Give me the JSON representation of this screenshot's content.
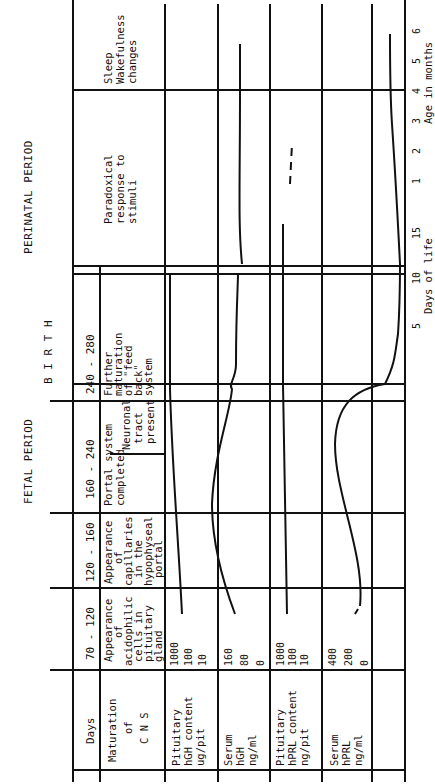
{
  "periods": {
    "fetal": "FETAL PERIOD",
    "birth": "B I R T H",
    "perinatal": "PERINATAL PERIOD"
  },
  "header": {
    "days_label": "Days",
    "columns": [
      "70 - 120",
      "120 - 160",
      "160 - 240",
      "240 - 280"
    ]
  },
  "cns_row": {
    "label_lines": [
      "Maturation",
      "of",
      "C N S"
    ],
    "cells": [
      [
        "Appearance",
        "of",
        "acidophilic",
        "cells in",
        "pituitary",
        "gland"
      ],
      [
        "Appearance",
        "of",
        "capillaries",
        "in the",
        "hypophyseal",
        "portal",
        "system"
      ],
      [
        "Portal system",
        "completed"
      ],
      [
        "Further",
        "maturation",
        "of \"feed",
        "back\"",
        "system"
      ]
    ],
    "neuronal": [
      "Neuronal",
      "tract",
      "present"
    ],
    "perinatal": [
      "Paradoxical",
      "response to",
      "stimuli"
    ],
    "postnatal": [
      "Sleep",
      "Wakefulness",
      "changes"
    ]
  },
  "rows": [
    {
      "label": [
        "Pituitary",
        "hGH content",
        "ug/pit"
      ],
      "ticks": [
        "1000",
        "100",
        "10"
      ]
    },
    {
      "label": [
        "Serum",
        "hGH",
        "ng/ml"
      ],
      "ticks": [
        "160",
        "80",
        "0"
      ]
    },
    {
      "label": [
        "Pituitary",
        "hPRL content",
        "ng/pit"
      ],
      "ticks": [
        "1000",
        "100",
        "10"
      ]
    },
    {
      "label": [
        "Serum",
        "hPRL",
        "ng/ml"
      ],
      "ticks": [
        "400",
        "200",
        "0"
      ]
    }
  ],
  "axes": {
    "days_ticks": [
      "5",
      "10",
      "15"
    ],
    "days_label": "Days of life",
    "months_ticks": [
      "1",
      "2",
      "3",
      "4",
      "5",
      "6"
    ],
    "months_label": "Age in months"
  }
}
